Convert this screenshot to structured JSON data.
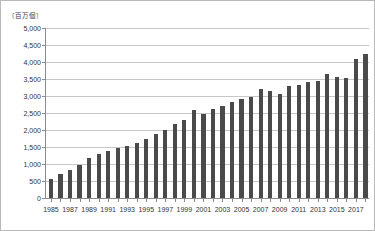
{
  "figure": {
    "unit_label": "〔百万個〕",
    "background_color": "#ffffff",
    "border_color": "#b9b9b9",
    "bar_color": "#4a4a4a",
    "gridline_color": "#c6c6c6",
    "axis_color": "#8c8c8c"
  },
  "chart_data": {
    "type": "bar",
    "title": "",
    "xlabel": "",
    "ylabel": "〔百万個〕",
    "ylim": [
      0,
      5000
    ],
    "ytick_labels": [
      "5,000",
      "4,500",
      "4,000",
      "3,500",
      "3,000",
      "2,500",
      "2,000",
      "1,500",
      "1,000",
      "500",
      "0"
    ],
    "ytick_values": [
      5000,
      4500,
      4000,
      3500,
      3000,
      2500,
      2000,
      1500,
      1000,
      500,
      0
    ],
    "grid": true,
    "legend": false,
    "categories": [
      "1985",
      "1986",
      "1987",
      "1988",
      "1989",
      "1990",
      "1991",
      "1992",
      "1993",
      "1994",
      "1995",
      "1996",
      "1997",
      "1998",
      "1999",
      "2000",
      "2001",
      "2002",
      "2003",
      "2004",
      "2005",
      "2006",
      "2007",
      "2008",
      "2009",
      "2010",
      "2011",
      "2012",
      "2013",
      "2014",
      "2015",
      "2016",
      "2017",
      "2018"
    ],
    "visible_xtick_labels": [
      "1985",
      "1987",
      "1989",
      "1991",
      "1993",
      "1995",
      "1997",
      "1999",
      "2001",
      "2003",
      "2005",
      "2007",
      "2009",
      "2011",
      "2013",
      "2015",
      "2017"
    ],
    "values": [
      560,
      700,
      830,
      980,
      1180,
      1280,
      1380,
      1460,
      1530,
      1620,
      1740,
      1880,
      2010,
      2170,
      2300,
      2600,
      2480,
      2620,
      2720,
      2830,
      2900,
      2980,
      3200,
      3150,
      3050,
      3280,
      3330,
      3400,
      3450,
      3640,
      3560,
      3520,
      4080,
      4250
    ]
  }
}
